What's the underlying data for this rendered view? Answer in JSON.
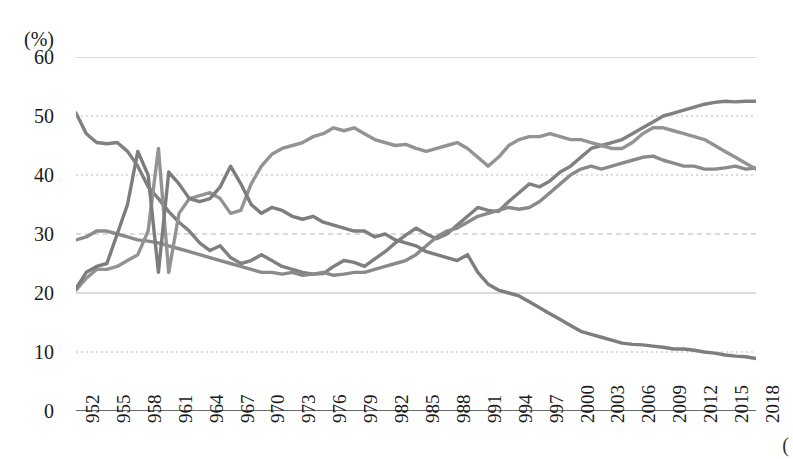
{
  "axis": {
    "unit": "(%)",
    "y_ticks": [
      60,
      50,
      40,
      30,
      20,
      10,
      0
    ],
    "edge_marker": "("
  },
  "chart_data": {
    "type": "line",
    "title": "",
    "xlabel": "",
    "ylabel": "(%)",
    "ylim": [
      0,
      60
    ],
    "xlim": [
      1952,
      2018
    ],
    "grid": true,
    "legend": "none",
    "colors": [
      "#808080",
      "#8a8a8a",
      "#939393",
      "#7d7d7d"
    ],
    "tick_labels": [
      "952",
      "955",
      "958",
      "961",
      "964",
      "967",
      "970",
      "973",
      "976",
      "979",
      "982",
      "985",
      "988",
      "991",
      "994",
      "997",
      "2000",
      "2003",
      "2006",
      "2009",
      "2012",
      "2015",
      "2018"
    ],
    "x": [
      1952,
      1953,
      1954,
      1955,
      1956,
      1957,
      1958,
      1959,
      1960,
      1961,
      1962,
      1963,
      1964,
      1965,
      1966,
      1967,
      1968,
      1969,
      1970,
      1971,
      1972,
      1973,
      1974,
      1975,
      1976,
      1977,
      1978,
      1979,
      1980,
      1981,
      1982,
      1983,
      1984,
      1985,
      1986,
      1987,
      1988,
      1989,
      1990,
      1991,
      1992,
      1993,
      1994,
      1995,
      1996,
      1997,
      1998,
      1999,
      2000,
      2001,
      2002,
      2003,
      2004,
      2005,
      2006,
      2007,
      2008,
      2009,
      2010,
      2011,
      2012,
      2013,
      2014,
      2015,
      2016,
      2017,
      2018
    ],
    "series": [
      {
        "name": "series-a",
        "color": "#808080",
        "values": [
          50.5,
          47.0,
          45.5,
          45.3,
          45.5,
          44.0,
          41.5,
          38.0,
          36.0,
          33.8,
          32.0,
          30.5,
          28.5,
          27.2,
          28.0,
          26.0,
          25.0,
          25.5,
          26.5,
          25.5,
          24.5,
          24.0,
          23.5,
          23.2,
          23.3,
          24.5,
          25.5,
          25.2,
          24.5,
          25.8,
          27.0,
          28.5,
          29.8,
          31.0,
          30.0,
          29.2,
          30.0,
          31.5,
          33.0,
          34.5,
          34.0,
          33.8,
          35.5,
          37.0,
          38.5,
          38.0,
          39.0,
          40.5,
          41.5,
          43.0,
          44.5,
          45.0,
          45.5,
          46.0,
          47.0,
          48.0,
          49.0,
          50.0,
          50.5,
          51.0,
          51.5,
          52.0,
          52.3,
          52.5,
          52.4,
          52.5,
          52.5
        ]
      },
      {
        "name": "series-b",
        "color": "#8a8a8a",
        "values": [
          29.0,
          29.5,
          30.5,
          30.5,
          30.0,
          29.5,
          29.0,
          28.8,
          28.5,
          28.0,
          27.5,
          27.0,
          26.5,
          26.0,
          25.5,
          25.0,
          24.5,
          24.0,
          23.5,
          23.5,
          23.2,
          23.5,
          23.0,
          23.2,
          23.5,
          23.0,
          23.2,
          23.5,
          23.5,
          24.0,
          24.5,
          25.0,
          25.5,
          26.5,
          28.0,
          29.5,
          30.5,
          31.0,
          32.0,
          33.0,
          33.5,
          34.0,
          34.5,
          34.2,
          34.5,
          35.5,
          37.0,
          38.5,
          40.0,
          41.0,
          41.5,
          41.0,
          41.5,
          42.0,
          42.5,
          43.0,
          43.2,
          42.5,
          42.0,
          41.5,
          41.5,
          41.0,
          41.0,
          41.2,
          41.5,
          41.0,
          41.2
        ]
      },
      {
        "name": "series-c",
        "color": "#939393",
        "values": [
          20.5,
          22.5,
          24.0,
          24.0,
          24.5,
          25.5,
          26.5,
          30.5,
          44.5,
          23.5,
          33.5,
          36.0,
          36.5,
          37.0,
          36.0,
          33.5,
          34.0,
          38.5,
          41.5,
          43.5,
          44.5,
          45.0,
          45.5,
          46.5,
          47.0,
          48.0,
          47.5,
          48.0,
          47.0,
          46.0,
          45.5,
          45.0,
          45.2,
          44.5,
          44.0,
          44.5,
          45.0,
          45.5,
          44.5,
          43.0,
          41.5,
          43.0,
          45.0,
          46.0,
          46.5,
          46.5,
          47.0,
          46.5,
          46.0,
          46.0,
          45.5,
          45.0,
          44.5,
          44.5,
          45.5,
          47.0,
          48.0,
          48.0,
          47.5,
          47.0,
          46.5,
          46.0,
          45.0,
          44.0,
          43.0,
          42.0,
          41.0
        ]
      },
      {
        "name": "series-d",
        "color": "#7d7d7d",
        "values": [
          20.8,
          23.5,
          24.5,
          25.0,
          30.0,
          35.0,
          44.0,
          40.0,
          23.5,
          40.5,
          38.5,
          36.0,
          35.5,
          36.0,
          38.0,
          41.5,
          38.5,
          35.0,
          33.5,
          34.5,
          34.0,
          33.0,
          32.5,
          33.0,
          32.0,
          31.5,
          31.0,
          30.5,
          30.5,
          29.5,
          30.0,
          29.0,
          28.5,
          28.0,
          27.0,
          26.5,
          26.0,
          25.5,
          26.5,
          23.5,
          21.5,
          20.5,
          20.0,
          19.5,
          18.5,
          17.5,
          16.5,
          15.5,
          14.5,
          13.5,
          13.0,
          12.5,
          12.0,
          11.5,
          11.3,
          11.2,
          11.0,
          10.8,
          10.5,
          10.5,
          10.3,
          10.0,
          9.8,
          9.5,
          9.3,
          9.2,
          8.9
        ]
      }
    ]
  }
}
